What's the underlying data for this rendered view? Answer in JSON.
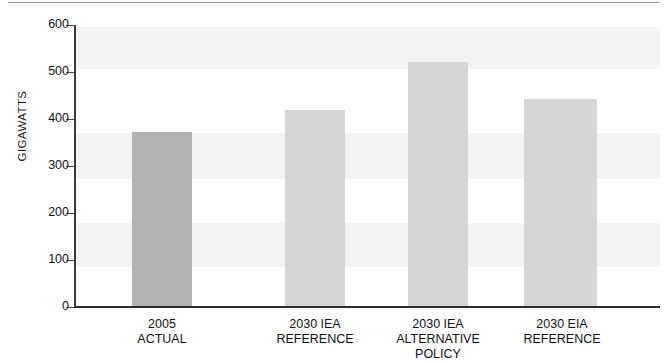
{
  "chart_data": {
    "type": "bar",
    "title": "",
    "subtitle": "",
    "xlabel": "",
    "ylabel": "GIGAWATTS",
    "ylim": [
      0,
      600
    ],
    "ytick_step": 100,
    "yticks": [
      "600",
      "500",
      "400",
      "300",
      "200",
      "100",
      "0"
    ],
    "grid": false,
    "legend": "none",
    "categories": [
      "2005\nACTUAL",
      "2030 IEA\nREFERENCE",
      "2030 IEA\nALTERNATIVE\nPOLICY",
      "2030 EIA\nREFERENCE"
    ],
    "values": [
      370,
      417,
      520,
      440
    ],
    "bar_colors": [
      "#b3b3b3",
      "#d6d6d6",
      "#d6d6d6",
      "#d6d6d6"
    ]
  },
  "axis": {
    "y_title": "GIGAWATTS"
  },
  "colors": {
    "bar_highlight": "#b3b3b3",
    "bar_default": "#d6d6d6",
    "axis": "#2d2d2d",
    "text": "#101010",
    "background": "#ffffff"
  }
}
